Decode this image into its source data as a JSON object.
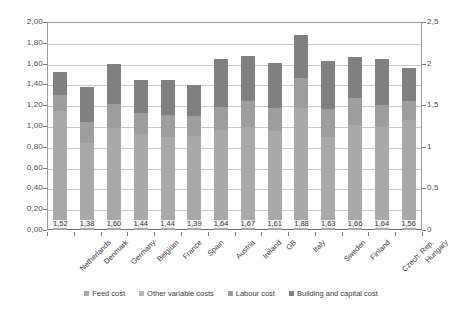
{
  "chart_data": {
    "type": "bar",
    "title": "",
    "subtitle": "",
    "xlabel": "",
    "ylabel": "",
    "stacked": true,
    "grid": true,
    "legend_position": "bottom",
    "categories": [
      "Netherlands",
      "Denmark",
      "Germany",
      "Belgium",
      "France",
      "Spain",
      "Austria",
      "Ireland",
      "GB",
      "Italy",
      "Sweden",
      "Finland",
      "Czech. Rep.",
      "Hungary"
    ],
    "totals": [
      1.52,
      1.38,
      1.6,
      1.44,
      1.44,
      1.39,
      1.64,
      1.67,
      1.61,
      1.88,
      1.63,
      1.66,
      1.64,
      1.56
    ],
    "data_labels": [
      "1,52",
      "1,38",
      "1,60",
      "1,44",
      "1,44",
      "1,39",
      "1,64",
      "1,67",
      "1,61",
      "1,88",
      "1,63",
      "1,66",
      "1,64",
      "1,56"
    ],
    "series": [
      {
        "name": "Feed cost",
        "values": [
          0.92,
          0.63,
          0.73,
          0.68,
          0.67,
          0.67,
          0.71,
          0.73,
          0.7,
          0.88,
          0.64,
          0.75,
          0.73,
          0.78
        ]
      },
      {
        "name": "Other variable costs",
        "values": [
          0.22,
          0.21,
          0.25,
          0.24,
          0.22,
          0.23,
          0.25,
          0.26,
          0.25,
          0.29,
          0.25,
          0.26,
          0.26,
          0.28
        ]
      },
      {
        "name": "Labour cost",
        "values": [
          0.16,
          0.2,
          0.23,
          0.21,
          0.22,
          0.2,
          0.22,
          0.25,
          0.22,
          0.29,
          0.27,
          0.26,
          0.21,
          0.18
        ]
      },
      {
        "name": "Building and capital cost",
        "values": [
          0.22,
          0.34,
          0.39,
          0.31,
          0.33,
          0.29,
          0.46,
          0.43,
          0.44,
          0.42,
          0.47,
          0.39,
          0.44,
          0.32
        ]
      }
    ],
    "left_axis": {
      "min": 0,
      "max": 2.0,
      "step": 0.2,
      "ticks": [
        "0,00",
        "0,20",
        "0,40",
        "0,60",
        "0,80",
        "1,00",
        "1,20",
        "1,40",
        "1,60",
        "1,80",
        "2,00"
      ]
    },
    "right_axis": {
      "min": 0,
      "max": 2.5,
      "step": 0.5,
      "ticks": [
        "0",
        "0,5",
        "1",
        "1,5",
        "2",
        "2,5"
      ]
    },
    "colors": {
      "feed": "#a9a9a9",
      "other": "#b3b3b3",
      "labour": "#9e9e9e",
      "capital": "#808080",
      "grid": "#c9c9c9",
      "axis": "#7a7a7a",
      "text": "#3b3b3b",
      "background": "#ffffff"
    }
  },
  "legend": {
    "items": [
      {
        "label": "Feed cost",
        "swatch": "feed"
      },
      {
        "label": "Other variable costs",
        "swatch": "other"
      },
      {
        "label": "Labour cost",
        "swatch": "labour"
      },
      {
        "label": "Building and capital cost",
        "swatch": "capital"
      }
    ]
  }
}
